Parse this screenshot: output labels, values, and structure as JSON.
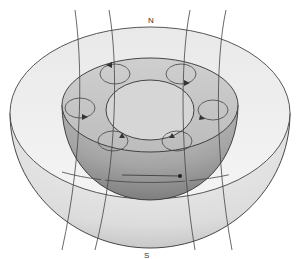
{
  "diagram": {
    "title": "",
    "labels": {
      "north": "N",
      "south": "S"
    },
    "parts": [
      "mantle-shell",
      "outer-core",
      "inner-core",
      "convection-cells",
      "magnetic-field-lines"
    ],
    "convection_cells_count": 6,
    "field_lines_count": 4,
    "colors": {
      "shell": "#e6e6e6",
      "core": "#b0b0b0",
      "inner": "#d4d4d4",
      "lines": "#444444"
    }
  }
}
